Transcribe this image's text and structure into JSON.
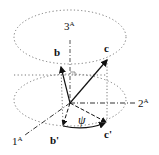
{
  "diagram": {
    "axes": [
      {
        "id": "1A",
        "label": "1",
        "superscript": "A"
      },
      {
        "id": "2A",
        "label": "2",
        "superscript": "A"
      },
      {
        "id": "3A",
        "label": "3",
        "superscript": "A"
      }
    ],
    "vectors": [
      {
        "id": "b",
        "label": "b"
      },
      {
        "id": "c",
        "label": "c"
      },
      {
        "id": "b_prime",
        "label": "b'"
      },
      {
        "id": "c_prime",
        "label": "c'"
      }
    ],
    "angle": {
      "label": "ψ"
    },
    "colors": {
      "line": "#111111",
      "dotted": "#777777",
      "background": "#ffffff"
    }
  }
}
